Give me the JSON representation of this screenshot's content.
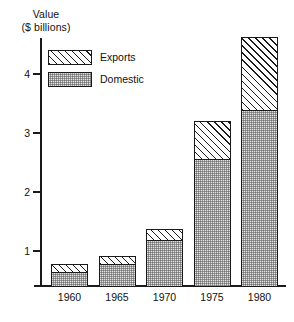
{
  "chart_data": {
    "type": "bar",
    "title": "",
    "subtitle": "",
    "xlabel": "",
    "ylabel": "Value\n($ billions)",
    "ylabel_line1": "Value",
    "ylabel_line2": "($ billions)",
    "stacked": true,
    "grid": false,
    "legend_position": "top-left inside plot",
    "categories": [
      "1960",
      "1965",
      "1970",
      "1975",
      "1980"
    ],
    "ylim": [
      0,
      4.6
    ],
    "yticks": [
      1,
      2,
      3,
      4
    ],
    "ytick_labels": [
      "1",
      "2",
      "3",
      "4"
    ],
    "series": [
      {
        "name": "Domestic",
        "fill": "stipple-grey",
        "values": [
          0.22,
          0.36,
          0.76,
          2.13,
          2.97
        ]
      },
      {
        "name": "Exports",
        "fill": "diagonal-hatch",
        "values": [
          0.14,
          0.14,
          0.19,
          0.65,
          1.23
        ]
      }
    ],
    "totals": [
      0.36,
      0.5,
      0.95,
      2.78,
      4.2
    ]
  },
  "axis": {
    "title_line1": "Value",
    "title_line2": "($ billions)",
    "y_tick_labels": [
      "4",
      "3",
      "2",
      "1"
    ],
    "x_tick_labels": [
      "1960",
      "1965",
      "1970",
      "1975",
      "1980"
    ]
  },
  "legend": {
    "items": [
      {
        "label": "Exports",
        "pattern": "diagonal-hatch"
      },
      {
        "label": "Domestic",
        "pattern": "stipple-grey"
      }
    ]
  },
  "colors": {
    "ink": "#1a1a1a",
    "background": "#ffffff",
    "domestic_fill": "#e3e3e3"
  }
}
